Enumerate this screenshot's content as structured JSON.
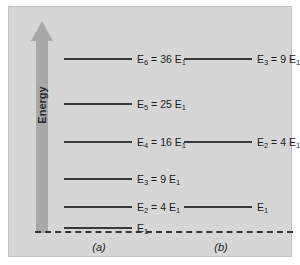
{
  "figure": {
    "axis_label": "Energy",
    "axis_direction": "up",
    "baseline_style": "dashed",
    "background_color": "#d6d6d6",
    "arrow_color": "#a8a8a8",
    "line_color": "#3a3a3a"
  },
  "chart_data": {
    "type": "diagram",
    "title": "",
    "subtitle": "",
    "xlabel": "",
    "ylabel": "Energy",
    "grid": false,
    "legend": "none",
    "ylim": [
      0,
      36
    ],
    "panels": [
      {
        "caption": "(a)",
        "levels": [
          {
            "index": 6,
            "label_n": "E",
            "label_sub": "6",
            "relation": " = 36 E",
            "relation_sub": "1",
            "value": 36,
            "y": 45
          },
          {
            "index": 5,
            "label_n": "E",
            "label_sub": "5",
            "relation": " = 25 E",
            "relation_sub": "1",
            "value": 25,
            "y": 90
          },
          {
            "index": 4,
            "label_n": "E",
            "label_sub": "4",
            "relation": " = 16 E",
            "relation_sub": "1",
            "value": 16,
            "y": 128
          },
          {
            "index": 3,
            "label_n": "E",
            "label_sub": "3",
            "relation": " = 9 E",
            "relation_sub": "1",
            "value": 9,
            "y": 165
          },
          {
            "index": 2,
            "label_n": "E",
            "label_sub": "2",
            "relation": " = 4 E",
            "relation_sub": "1",
            "value": 4,
            "y": 193
          },
          {
            "index": 1,
            "label_n": "E",
            "label_sub": "1",
            "relation": "",
            "relation_sub": "",
            "value": 1,
            "y": 214
          }
        ]
      },
      {
        "caption": "(b)",
        "levels": [
          {
            "index": 3,
            "label_n": "E",
            "label_sub": "3",
            "relation": " = 9 E",
            "relation_sub": "1",
            "value": 9,
            "y": 45
          },
          {
            "index": 2,
            "label_n": "E",
            "label_sub": "2",
            "relation": " = 4 E",
            "relation_sub": "1",
            "value": 4,
            "y": 128
          },
          {
            "index": 1,
            "label_n": "E",
            "label_sub": "1",
            "relation": "",
            "relation_sub": "",
            "value": 1,
            "y": 193
          }
        ]
      }
    ]
  }
}
